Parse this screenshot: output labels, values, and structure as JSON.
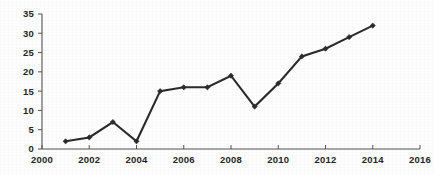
{
  "chart_data": {
    "type": "line",
    "title": "",
    "subtitle": "",
    "xlabel": "",
    "ylabel": "",
    "x": [
      2001,
      2002,
      2003,
      2004,
      2005,
      2006,
      2007,
      2008,
      2009,
      2010,
      2011,
      2012,
      2013,
      2014
    ],
    "values": [
      2,
      3,
      7,
      2,
      15,
      16,
      16,
      19,
      11,
      17,
      24,
      26,
      29,
      32
    ],
    "series": [
      {
        "name": "",
        "values": [
          2,
          3,
          7,
          2,
          15,
          16,
          16,
          19,
          11,
          17,
          24,
          26,
          29,
          32
        ]
      }
    ],
    "xlim": [
      2000,
      2016
    ],
    "ylim": [
      0,
      35
    ],
    "x_tick_labels": [
      "2000",
      "2002",
      "2004",
      "2006",
      "2008",
      "2010",
      "2012",
      "2014",
      "2016"
    ],
    "x_tick_values": [
      2000,
      2002,
      2004,
      2006,
      2008,
      2010,
      2012,
      2014,
      2016
    ],
    "y_tick_labels": [
      "0",
      "5",
      "10",
      "15",
      "20",
      "25",
      "30",
      "35"
    ],
    "y_tick_values": [
      0,
      5,
      10,
      15,
      20,
      25,
      30,
      35
    ],
    "grid": false,
    "legend": false,
    "legend_position": "none",
    "marker": "diamond",
    "annotations": [],
    "colors": {
      "line": "#2b2b2b",
      "marker": "#2b2b2b",
      "axis": "#555555",
      "tick_text": "#262626",
      "background": "#fdfdfd"
    }
  }
}
